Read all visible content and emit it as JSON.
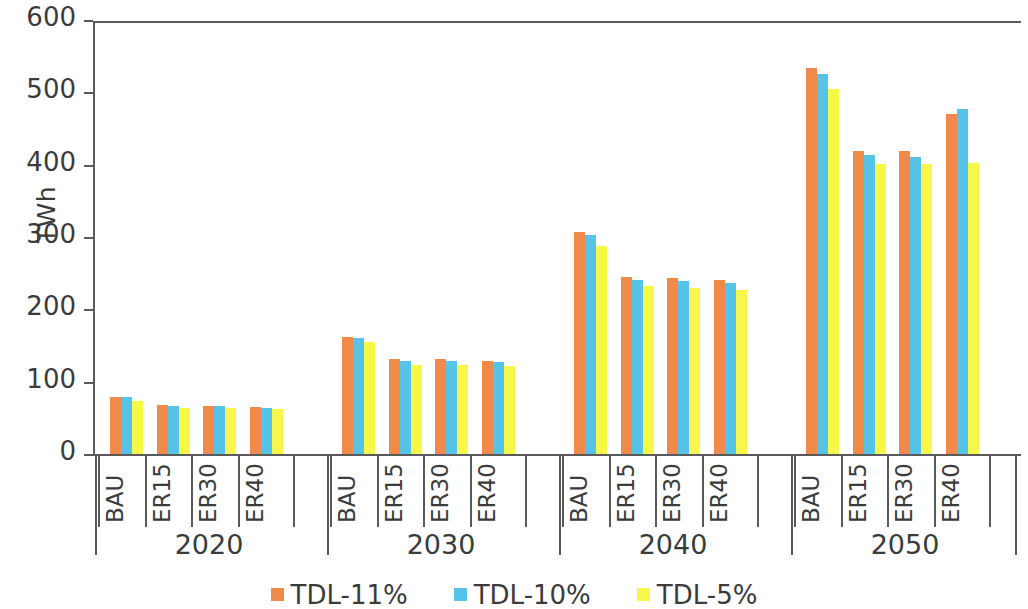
{
  "chart_data": {
    "type": "bar",
    "title": "",
    "xlabel": "",
    "ylabel": "TWh",
    "ylim": [
      0,
      600
    ],
    "yticks": [
      0,
      100,
      200,
      300,
      400,
      500,
      600
    ],
    "grid": false,
    "legend_position": "bottom",
    "group_labels": [
      "2020",
      "2030",
      "2040",
      "2050"
    ],
    "categories": [
      "BAU",
      "ER15",
      "ER30",
      "ER40",
      "BAU",
      "ER15",
      "ER30",
      "ER40",
      "BAU",
      "ER15",
      "ER30",
      "ER40",
      "BAU",
      "ER15",
      "ER30",
      "ER40"
    ],
    "scenario_labels": [
      "BAU",
      "ER15",
      "ER30",
      "ER40"
    ],
    "series": [
      {
        "name": "TDL-11%",
        "color": "#F08A4B",
        "values": [
          79,
          68,
          67,
          65,
          162,
          131,
          131,
          129,
          307,
          245,
          243,
          241,
          533,
          419,
          419,
          470
        ]
      },
      {
        "name": "TDL-10%",
        "color": "#56C4E8",
        "values": [
          79,
          66,
          66,
          64,
          160,
          129,
          129,
          127,
          303,
          241,
          239,
          237,
          526,
          413,
          411,
          477
        ]
      },
      {
        "name": "TDL-5%",
        "color": "#F7F74A",
        "values": [
          73,
          63,
          63,
          62,
          155,
          123,
          123,
          121,
          288,
          232,
          229,
          227,
          505,
          401,
          401,
          402
        ]
      }
    ]
  },
  "legend": {
    "items": [
      {
        "label": "TDL-11%",
        "color": "#F08A4B"
      },
      {
        "label": "TDL-10%",
        "color": "#56C4E8"
      },
      {
        "label": "TDL-5%",
        "color": "#F7F74A"
      }
    ]
  },
  "axis": {
    "y_title": "TWh",
    "y_tick_labels": [
      "600",
      "500",
      "400",
      "300",
      "200",
      "100",
      "0"
    ]
  }
}
